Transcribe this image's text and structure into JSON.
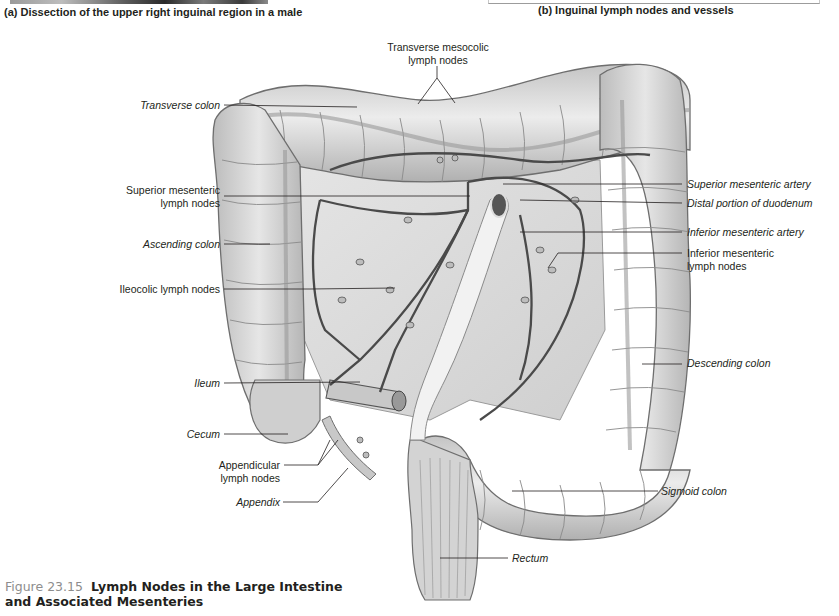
{
  "top_captions": {
    "a": "(a) Dissection of the upper right inguinal region in a male",
    "b": "(b) Inguinal lymph nodes and vessels"
  },
  "labels": {
    "transverse_mesocolic_nodes_line1": "Transverse mesocolic",
    "transverse_mesocolic_nodes_line2": "lymph nodes",
    "transverse_colon": "Transverse colon",
    "superior_mesenteric_nodes_line1": "Superior mesenteric",
    "superior_mesenteric_nodes_line2": "lymph nodes",
    "ascending_colon": "Ascending colon",
    "ileocolic_nodes": "Ileocolic lymph nodes",
    "ileum": "Ileum",
    "cecum": "Cecum",
    "appendicular_nodes_line1": "Appendicular",
    "appendicular_nodes_line2": "lymph nodes",
    "appendix": "Appendix",
    "superior_mesenteric_artery": "Superior mesenteric artery",
    "distal_duodenum": "Distal portion of duodenum",
    "inferior_mesenteric_artery": "Inferior mesenteric artery",
    "inferior_mesenteric_nodes_line1": "Inferior mesenteric",
    "inferior_mesenteric_nodes_line2": "lymph nodes",
    "descending_colon": "Descending colon",
    "sigmoid_colon": "Sigmoid colon",
    "rectum": "Rectum"
  },
  "figure": {
    "number": "Figure 23.15",
    "title_line1": "Lymph Nodes in the Large Intestine",
    "title_line2": "and Associated Mesenteries"
  },
  "colors": {
    "text": "#231f20",
    "figure_number": "#8d8d8d",
    "organ_fill": "#d9d9d9",
    "organ_stroke": "#6e6e6e",
    "vessel": "#4a4a4a",
    "leader_line": "#231f20"
  }
}
